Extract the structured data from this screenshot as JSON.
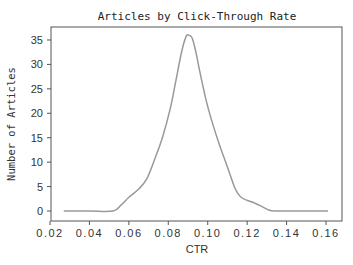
{
  "chart_data": {
    "type": "line",
    "title": "Articles by Click-Through Rate",
    "xlabel": "CTR",
    "ylabel": "Number of Articles",
    "xlim": [
      0.02,
      0.165
    ],
    "ylim": [
      -1,
      38
    ],
    "x_ticks": [
      0.02,
      0.04,
      0.06,
      0.08,
      0.1,
      0.12,
      0.14,
      0.16
    ],
    "x_tick_labels": [
      "0.02",
      "0.04",
      "0.06",
      "0.08",
      "0.10",
      "0.12",
      "0.14",
      "0.16"
    ],
    "y_ticks": [
      0,
      5,
      10,
      15,
      20,
      25,
      30,
      35
    ],
    "y_tick_labels": [
      "0",
      "5",
      "10",
      "15",
      "20",
      "25",
      "30",
      "35"
    ],
    "grid": false,
    "legend": null,
    "line_color": "#999999",
    "series": [
      {
        "name": "density",
        "x": [
          0.027,
          0.04,
          0.052,
          0.056,
          0.06,
          0.065,
          0.069,
          0.073,
          0.077,
          0.081,
          0.084,
          0.087,
          0.089,
          0.09,
          0.092,
          0.094,
          0.096,
          0.099,
          0.102,
          0.106,
          0.11,
          0.114,
          0.117,
          0.12,
          0.124,
          0.128,
          0.131,
          0.134,
          0.145,
          0.161
        ],
        "y": [
          0,
          0,
          0,
          1.2,
          2.8,
          4.5,
          6.5,
          10.5,
          15,
          21,
          27,
          33,
          35.7,
          36,
          35.5,
          32.5,
          28.5,
          23,
          18.5,
          13.5,
          9,
          4.5,
          2.8,
          2.2,
          1.6,
          0.8,
          0.2,
          0,
          0,
          0
        ]
      }
    ]
  }
}
